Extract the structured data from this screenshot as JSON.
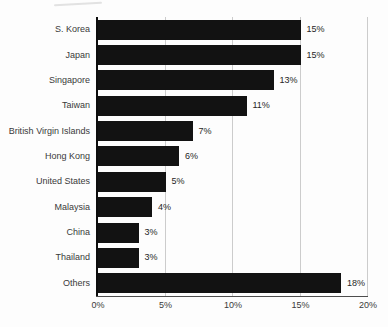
{
  "chart_data": {
    "type": "bar",
    "orientation": "horizontal",
    "title": "",
    "categories": [
      "S. Korea",
      "Japan",
      "Singapore",
      "Taiwan",
      "British Virgin Islands",
      "Hong Kong",
      "United States",
      "Malaysia",
      "China",
      "Thailand",
      "Others"
    ],
    "values": [
      15,
      15,
      13,
      11,
      7,
      6,
      5,
      4,
      3,
      3,
      18
    ],
    "value_labels": [
      "15%",
      "15%",
      "13%",
      "11%",
      "7%",
      "6%",
      "5%",
      "4%",
      "3%",
      "3%",
      "18%"
    ],
    "xlim": [
      0,
      20
    ],
    "x_ticks": [
      {
        "value": 0,
        "label": "0%"
      },
      {
        "value": 5,
        "label": "5%"
      },
      {
        "value": 10,
        "label": "10%"
      },
      {
        "value": 15,
        "label": "15%"
      },
      {
        "value": 20,
        "label": "20%"
      }
    ],
    "grid": "vertical gridlines at each x tick except 0",
    "legend": "none",
    "colors": {
      "bar": "#121212",
      "gridline": "#cccccc",
      "y_axis_line": "#0d0d0d",
      "baseline": "#4d4d4d",
      "category_label": "#3a3a3a",
      "value_label": "#262626",
      "tick_label": "#3a3a3a",
      "background": "#fdfdfd"
    }
  }
}
